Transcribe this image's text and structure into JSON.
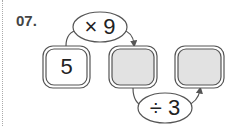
{
  "problem": {
    "number": "07."
  },
  "boxes": [
    {
      "value": "5",
      "fill": "#ffffff"
    },
    {
      "value": "",
      "fill": "#e2e2e2"
    },
    {
      "value": "",
      "fill": "#e2e2e2"
    }
  ],
  "operations": [
    {
      "label": "× 9"
    },
    {
      "label": "÷ 3"
    }
  ]
}
